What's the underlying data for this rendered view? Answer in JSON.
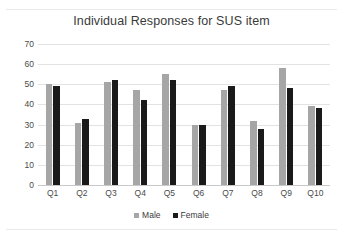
{
  "chart_data": {
    "type": "bar",
    "title": "Individual Responses for SUS item",
    "xlabel": "",
    "ylabel": "",
    "categories": [
      "Q1",
      "Q2",
      "Q3",
      "Q4",
      "Q5",
      "Q6",
      "Q7",
      "Q8",
      "Q9",
      "Q10"
    ],
    "series": [
      {
        "name": "Male",
        "color": "#a6a6a6",
        "values": [
          50,
          31,
          51,
          47,
          55,
          30,
          47,
          32,
          58,
          39
        ]
      },
      {
        "name": "Female",
        "color": "#1a1a1a",
        "values": [
          49,
          33,
          52,
          42,
          52,
          30,
          49,
          28,
          48,
          38
        ]
      }
    ],
    "ylim": [
      0,
      70
    ],
    "ytick_step": 10,
    "yticks": [
      "0",
      "10",
      "20",
      "30",
      "40",
      "50",
      "60",
      "70"
    ],
    "grid": true,
    "legend_position": "bottom"
  },
  "legend": {
    "entries": [
      {
        "label": "Male"
      },
      {
        "label": "Female"
      }
    ]
  }
}
